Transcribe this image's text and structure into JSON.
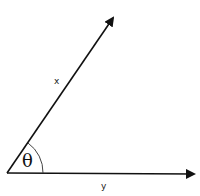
{
  "diagram": {
    "type": "angle-between-vectors",
    "vectors": [
      {
        "name": "x",
        "label": "x",
        "from": [
          7,
          173
        ],
        "to": [
          116,
          14
        ]
      },
      {
        "name": "y",
        "label": "y",
        "from": [
          7,
          173
        ],
        "to": [
          196,
          175
        ]
      }
    ],
    "angle": {
      "label": "θ",
      "vertex": [
        7,
        173
      ],
      "radius": 36
    },
    "colors": {
      "stroke": "#111111",
      "background": "#ffffff"
    }
  }
}
